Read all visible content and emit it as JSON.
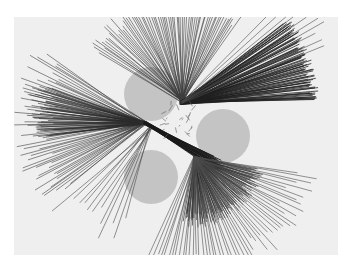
{
  "figure": {
    "width": 353,
    "height": 267,
    "panel": {
      "x": 14,
      "y": 17,
      "width": 324,
      "height": 238,
      "fill": "#efefef"
    },
    "colors": {
      "page": "#ffffff",
      "panel": "#efefef",
      "obstacle": "#c4c4c4",
      "ray": "#4a4a4a",
      "ray_dense": "#1e1e1e",
      "bar": "#cfcfcf"
    },
    "obstacles": [
      {
        "name": "circle-top-left",
        "cx": 151,
        "cy": 94,
        "r": 27
      },
      {
        "name": "circle-right",
        "cx": 223,
        "cy": 136,
        "r": 27
      },
      {
        "name": "circle-bottom-left",
        "cx": 151,
        "cy": 177,
        "r": 27
      }
    ],
    "bar": {
      "x": 37,
      "y": 122,
      "width": 100,
      "height": 9
    },
    "ray_fans": [
      {
        "name": "fan-top",
        "origin": [
          182,
          101
        ],
        "angle_start": -150,
        "angle_end": -55,
        "count": 70,
        "length_min": 90,
        "length_max": 110,
        "width": 0.7,
        "color": "#3c3c3c"
      },
      {
        "name": "fan-top-right-dense",
        "origin": [
          181,
          103
        ],
        "angle_start": -38,
        "angle_end": -1,
        "count": 90,
        "length_min": 128,
        "length_max": 138,
        "width": 0.9,
        "color": "#1e1e1e"
      },
      {
        "name": "fan-top-right-long",
        "origin": [
          181,
          103
        ],
        "angle_start": -45,
        "angle_end": -22,
        "count": 10,
        "length_min": 150,
        "length_max": 165,
        "width": 0.7,
        "color": "#4a4a4a"
      },
      {
        "name": "fan-left",
        "origin": [
          145,
          123
        ],
        "angle_start": 140,
        "angle_end": 215,
        "count": 60,
        "length_min": 95,
        "length_max": 135,
        "width": 0.7,
        "color": "#3e3e3e"
      },
      {
        "name": "fan-left-dense",
        "origin": [
          145,
          123
        ],
        "angle_start": 172,
        "angle_end": 200,
        "count": 45,
        "length_min": 90,
        "length_max": 120,
        "width": 0.7,
        "color": "#2a2a2a"
      },
      {
        "name": "fan-bottom-left",
        "origin": [
          150,
          128
        ],
        "angle_start": 105,
        "angle_end": 140,
        "count": 12,
        "length_min": 90,
        "length_max": 130,
        "width": 0.7,
        "color": "#4a4a4a"
      },
      {
        "name": "fan-diagonal-dense",
        "origin": [
          145,
          123
        ],
        "angle_start": 26,
        "angle_end": 34,
        "count": 30,
        "length_min": 75,
        "length_max": 90,
        "width": 1.0,
        "color": "#1a1a1a"
      },
      {
        "name": "fan-bottom-dense",
        "origin": [
          195,
          158
        ],
        "angle_start": 10,
        "angle_end": 100,
        "count": 110,
        "length_min": 55,
        "length_max": 70,
        "width": 0.8,
        "color": "#2a2a2a"
      },
      {
        "name": "fan-bottom-long",
        "origin": [
          195,
          158
        ],
        "angle_start": 8,
        "angle_end": 115,
        "count": 55,
        "length_min": 95,
        "length_max": 125,
        "width": 0.7,
        "color": "#4e4e4e"
      }
    ],
    "clutter": {
      "origin": [
        178,
        120
      ],
      "count": 25,
      "radius": 18,
      "color": "#5a5a5a"
    }
  }
}
